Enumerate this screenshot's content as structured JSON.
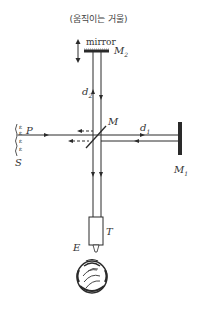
{
  "caption": "(움직이는 거울)",
  "labels": {
    "mirror_word": "mirror",
    "m2": "M",
    "m2_sub": "2",
    "m1": "M",
    "m1_sub": "1",
    "m": "M",
    "d1": "d",
    "d1_sub": "1",
    "d2": "d",
    "d2_sub": "2",
    "p": "P",
    "s": "S",
    "t": "T",
    "e": "E"
  },
  "source_glyph": "ε",
  "icons": {
    "movable_arrow": "double-vertical-arrow-icon",
    "source_waves": "wavefront-icon",
    "observer": "observer-head-icon",
    "telescope": "telescope-icon"
  },
  "colors": {
    "line": "#2a2a2a",
    "background": "#ffffff"
  }
}
